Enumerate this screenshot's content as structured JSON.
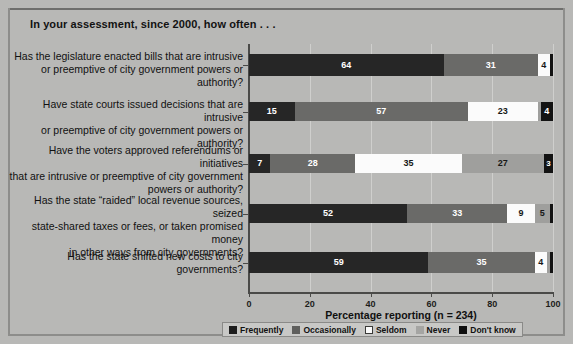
{
  "title": "In your assessment, since 2000, how often . . .",
  "chart_data": {
    "type": "bar",
    "orientation": "horizontal",
    "stacked": true,
    "stacked_percent": true,
    "title": "In your assessment, since 2000, how often . . .",
    "xlabel": "Percentage reporting (n = 234)",
    "ylabel": "",
    "xlim": [
      0,
      100
    ],
    "xticks": [
      0,
      20,
      40,
      60,
      80,
      100
    ],
    "xticklabels": [
      "0",
      "20",
      "40",
      "60",
      "80",
      "100"
    ],
    "grid": true,
    "legend_position": "bottom",
    "categories": [
      "Has the legislature enacted bills that are intrusive or preemptive of city government powers or authority?",
      "Have state courts issued decisions that are intrusive or preemptive of city government powers or authority?",
      "Have the voters approved referendums or initiatives that are intrusive or preemptive of city government powers or authority?",
      "Has the state “raided” local revenue sources, seized state-shared taxes or fees, or taken promised money in other ways from city governments?",
      "Has the state shifted new costs to city governments?"
    ],
    "category_lines": [
      [
        "Has the legislature enacted bills that are intrusive",
        "or preemptive of city government powers or authority?"
      ],
      [
        "Have state courts issued decisions that are intrusive",
        "or preemptive of city government powers or authority?"
      ],
      [
        "Have the voters approved referendums or initiatives",
        "that are intrusive or preemptive of city government",
        "powers or authority?"
      ],
      [
        "Has the state “raided” local revenue sources, seized",
        "state-shared taxes or fees, or taken promised money",
        "in other ways from city governments?"
      ],
      [
        "Has the state shifted new costs to city governments?"
      ]
    ],
    "series": [
      {
        "name": "Frequently",
        "color": "#262626",
        "values": [
          64,
          15,
          7,
          52,
          59
        ]
      },
      {
        "name": "Occasionally",
        "color": "#6a6a68",
        "values": [
          31,
          57,
          28,
          33,
          35
        ]
      },
      {
        "name": "Seldom",
        "color": "#fbfbfb",
        "values": [
          4,
          23,
          35,
          9,
          4
        ]
      },
      {
        "name": "Never",
        "color": "#9f9f9d",
        "values": [
          0,
          1,
          27,
          5,
          1
        ]
      },
      {
        "name": "Don't know",
        "color": "#131313",
        "values": [
          1,
          4,
          3,
          1,
          1
        ]
      }
    ],
    "bar_labels": [
      [
        "64",
        "31",
        "4",
        "",
        ""
      ],
      [
        "15",
        "57",
        "23",
        "",
        "4"
      ],
      [
        "7",
        "28",
        "35",
        "27",
        "3"
      ],
      [
        "52",
        "33",
        "9",
        "5",
        ""
      ],
      [
        "59",
        "35",
        "4",
        "",
        ""
      ]
    ]
  },
  "legend": [
    {
      "label": "Frequently"
    },
    {
      "label": "Occasionally"
    },
    {
      "label": "Seldom"
    },
    {
      "label": "Never"
    },
    {
      "label": "Don't know"
    }
  ],
  "axis": {
    "xlabel": "Percentage reporting (n = 234)",
    "ticklabels": [
      "0",
      "20",
      "40",
      "60",
      "80",
      "100"
    ]
  }
}
